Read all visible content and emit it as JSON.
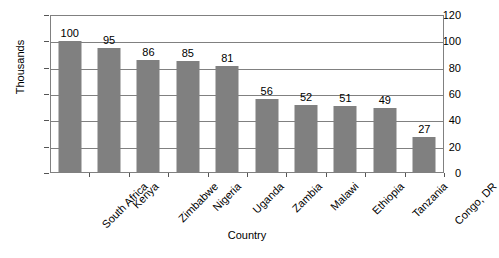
{
  "chart_data": {
    "type": "bar",
    "title": "",
    "subtitle": "",
    "xlabel": "Country",
    "ylabel": "Thousands",
    "categories": [
      "South Africa",
      "Kenya",
      "Zimbabwe",
      "Nigeria",
      "Uganda",
      "Zambia",
      "Malawi",
      "Ethiopia",
      "Tanzania",
      "Congo, DR"
    ],
    "values": [
      100,
      95,
      86,
      85,
      81,
      56,
      52,
      51,
      49,
      27
    ],
    "value_labels": [
      "100",
      "95",
      "86",
      "85",
      "81",
      "56",
      "52",
      "51",
      "49",
      "27"
    ],
    "ylim": [
      0,
      120
    ],
    "ytick_labels": [
      "0",
      "20",
      "40",
      "60",
      "80",
      "100",
      "120"
    ],
    "ytick_values": [
      0,
      20,
      40,
      60,
      80,
      100,
      120
    ],
    "grid": true,
    "grid_axis": "y",
    "legend": false,
    "legend_position": "none",
    "bar_color": "#808080",
    "axis_color": "#808080",
    "background_color": "#ffffff",
    "text_color": "#000000",
    "xtick_label_rotation": -45
  }
}
